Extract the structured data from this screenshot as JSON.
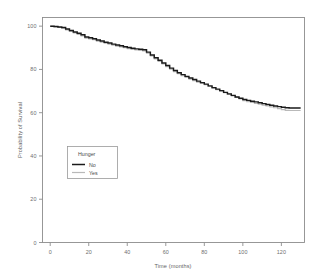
{
  "chart_data": {
    "type": "line",
    "title": "",
    "xlabel": "Time (months)",
    "ylabel": "Probability of Survival",
    "xlim": [
      -4,
      132
    ],
    "ylim": [
      0,
      104
    ],
    "xticks": [
      0,
      20,
      40,
      60,
      80,
      100,
      120
    ],
    "xticklabels": [
      "0",
      "20",
      "40",
      "60",
      "80",
      "100",
      "120"
    ],
    "yticks": [
      0,
      20,
      40,
      60,
      80,
      100
    ],
    "yticklabels": [
      "0",
      "20",
      "40",
      "60",
      "80",
      "100"
    ],
    "grid": false,
    "legend": {
      "title": "Hunger",
      "position": "inside-lower-left",
      "entries": [
        {
          "label": "No",
          "color": "#1a1a1a",
          "style": "solid-thick"
        },
        {
          "label": "Yes",
          "color": "#b9b9b9",
          "style": "solid-thin"
        }
      ]
    },
    "series": [
      {
        "name": "No",
        "color": "#1a1a1a",
        "x": [
          0,
          2,
          4,
          6,
          8,
          10,
          12,
          14,
          16,
          18,
          20,
          22,
          24,
          26,
          28,
          30,
          32,
          34,
          36,
          38,
          40,
          42,
          44,
          46,
          48,
          50,
          52,
          54,
          56,
          58,
          60,
          62,
          64,
          66,
          68,
          70,
          72,
          74,
          76,
          78,
          80,
          82,
          84,
          86,
          88,
          90,
          92,
          94,
          96,
          98,
          100,
          102,
          104,
          106,
          108,
          110,
          112,
          114,
          116,
          118,
          120,
          122,
          124,
          126,
          128,
          130
        ],
        "y": [
          100.0,
          99.8,
          99.6,
          99.4,
          98.7,
          98.0,
          97.3,
          96.7,
          96.0,
          95.0,
          94.6,
          94.2,
          93.6,
          93.1,
          92.6,
          92.2,
          91.7,
          91.3,
          90.9,
          90.5,
          90.1,
          89.8,
          89.5,
          89.3,
          89.1,
          88.0,
          86.7,
          85.4,
          84.2,
          83.0,
          81.8,
          80.6,
          79.5,
          78.5,
          77.6,
          76.8,
          76.0,
          75.3,
          74.6,
          73.9,
          73.2,
          72.4,
          71.6,
          70.9,
          70.2,
          69.4,
          68.7,
          68.0,
          67.3,
          66.7,
          66.1,
          65.7,
          65.3,
          65.0,
          64.6,
          64.2,
          63.8,
          63.4,
          63.1,
          62.8,
          62.5,
          62.3,
          62.2,
          62.2,
          62.2,
          62.2
        ]
      },
      {
        "name": "Yes",
        "color": "#b9b9b9",
        "x": [
          0,
          2,
          4,
          6,
          8,
          10,
          12,
          14,
          16,
          18,
          20,
          22,
          24,
          26,
          28,
          30,
          32,
          34,
          36,
          38,
          40,
          42,
          44,
          46,
          48,
          50,
          52,
          54,
          56,
          58,
          60,
          62,
          64,
          66,
          68,
          70,
          72,
          74,
          76,
          78,
          80,
          82,
          84,
          86,
          88,
          90,
          92,
          94,
          96,
          98,
          100,
          102,
          104,
          106,
          108,
          110,
          112,
          114,
          116,
          118,
          120,
          122,
          124,
          126,
          128,
          130
        ],
        "y": [
          100.0,
          99.7,
          99.4,
          99.1,
          98.3,
          97.6,
          96.9,
          96.2,
          95.5,
          94.5,
          94.1,
          93.7,
          93.1,
          92.6,
          92.1,
          91.7,
          91.2,
          90.8,
          90.4,
          90.0,
          89.6,
          89.3,
          89.0,
          88.8,
          88.6,
          87.5,
          86.2,
          84.9,
          83.7,
          82.5,
          81.3,
          80.1,
          79.0,
          78.0,
          77.1,
          76.3,
          75.5,
          74.8,
          74.1,
          73.5,
          72.9,
          72.1,
          71.3,
          70.6,
          69.9,
          69.2,
          68.5,
          67.8,
          67.1,
          66.4,
          65.6,
          65.1,
          64.7,
          64.3,
          63.9,
          63.5,
          63.1,
          62.7,
          62.3,
          61.9,
          61.4,
          61.1,
          61.0,
          61.0,
          61.0,
          61.0
        ]
      }
    ]
  }
}
